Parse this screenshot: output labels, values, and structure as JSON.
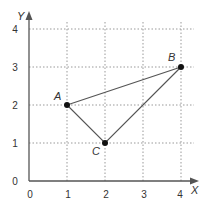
{
  "diagram": {
    "type": "coordinate-plane-triangle",
    "axes": {
      "x_label": "X",
      "y_label": "Y",
      "x_ticks": [
        "0",
        "1",
        "2",
        "3",
        "4"
      ],
      "y_ticks": [
        "0",
        "1",
        "2",
        "3",
        "4"
      ],
      "grid": "dotted"
    },
    "points": [
      {
        "label": "A",
        "x": 1,
        "y": 2
      },
      {
        "label": "B",
        "x": 4,
        "y": 3
      },
      {
        "label": "C",
        "x": 2,
        "y": 1
      }
    ],
    "colors": {
      "axis": "#555555",
      "grid": "#999999",
      "triangle": "#555555",
      "point": "#111111"
    }
  }
}
